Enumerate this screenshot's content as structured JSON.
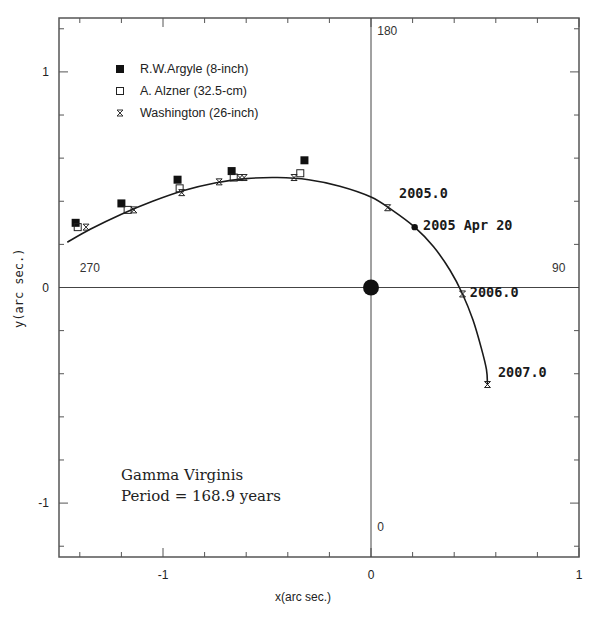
{
  "chart_data": {
    "type": "scatter",
    "title": "Gamma Virginis",
    "subtitle": "Period = 168.9 years",
    "xlabel": "x(arc sec.)",
    "ylabel": "y(arc sec.)",
    "xlim": [
      -1.5,
      1.0
    ],
    "ylim": [
      -1.25,
      1.25
    ],
    "grid": false,
    "x_ticks_major": [
      -1,
      0,
      1
    ],
    "x_tick_labels": [
      "-1",
      "0",
      "1"
    ],
    "y_ticks_major": [
      -1,
      0,
      1
    ],
    "y_tick_labels": [
      "-1",
      "0",
      "1"
    ],
    "minor_tick_step": 0.2,
    "legend_position": "upper-left",
    "compass_labels": [
      {
        "text": "180",
        "x": 0.03,
        "y": 1.17
      },
      {
        "text": "270",
        "x": -1.4,
        "y": 0.07
      },
      {
        "text": "90",
        "x": 0.87,
        "y": 0.07
      },
      {
        "text": "0",
        "x": 0.03,
        "y": -1.13
      }
    ],
    "primary_star": {
      "x": 0,
      "y": 0
    },
    "series": [
      {
        "name": "R.W.Argyle (8-inch)",
        "marker": "filled-square",
        "points": [
          [
            -1.42,
            0.3
          ],
          [
            -1.2,
            0.39
          ],
          [
            -0.93,
            0.5
          ],
          [
            -0.67,
            0.54
          ],
          [
            -0.32,
            0.59
          ]
        ]
      },
      {
        "name": "A. Alzner (32.5-cm)",
        "marker": "open-square",
        "points": [
          [
            -1.41,
            0.28
          ],
          [
            -1.17,
            0.36
          ],
          [
            -0.92,
            0.46
          ],
          [
            -0.66,
            0.51
          ],
          [
            -0.34,
            0.53
          ]
        ]
      },
      {
        "name": "Washington (26-inch)",
        "marker": "cross-box",
        "points": [
          [
            -1.37,
            0.28
          ],
          [
            -1.14,
            0.36
          ],
          [
            -0.91,
            0.44
          ],
          [
            -0.73,
            0.49
          ],
          [
            -0.63,
            0.51
          ],
          [
            -0.61,
            0.51
          ],
          [
            -0.37,
            0.51
          ],
          [
            0.08,
            0.37
          ],
          [
            0.44,
            -0.03
          ],
          [
            0.56,
            -0.45
          ]
        ]
      }
    ],
    "orbit_curve": [
      [
        -1.46,
        0.21
      ],
      [
        -1.35,
        0.27
      ],
      [
        -1.2,
        0.34
      ],
      [
        -1.05,
        0.4
      ],
      [
        -0.9,
        0.45
      ],
      [
        -0.75,
        0.485
      ],
      [
        -0.6,
        0.505
      ],
      [
        -0.45,
        0.51
      ],
      [
        -0.3,
        0.5
      ],
      [
        -0.15,
        0.47
      ],
      [
        0.0,
        0.42
      ],
      [
        0.1,
        0.36
      ],
      [
        0.21,
        0.28
      ],
      [
        0.3,
        0.19
      ],
      [
        0.38,
        0.08
      ],
      [
        0.44,
        -0.03
      ],
      [
        0.49,
        -0.15
      ],
      [
        0.53,
        -0.28
      ],
      [
        0.555,
        -0.38
      ],
      [
        0.56,
        -0.45
      ]
    ],
    "annotations": [
      {
        "text": "2005.0",
        "x": 0.08,
        "y": 0.37,
        "label_x": 0.135,
        "label_y": 0.44
      },
      {
        "text": "2005 Apr 20",
        "x": 0.21,
        "y": 0.28,
        "label_x": 0.25,
        "label_y": 0.29,
        "marker": "filled-dot"
      },
      {
        "text": "2006.0",
        "x": 0.44,
        "y": -0.03,
        "label_x": 0.475,
        "label_y": -0.02
      },
      {
        "text": "2007.0",
        "x": 0.56,
        "y": -0.45,
        "label_x": 0.61,
        "label_y": -0.39
      }
    ]
  },
  "legend": {
    "items": [
      {
        "label": "R.W.Argyle (8-inch)",
        "marker": "filled-square"
      },
      {
        "label": "A. Alzner (32.5-cm)",
        "marker": "open-square"
      },
      {
        "label": "Washington (26-inch)",
        "marker": "cross-box"
      }
    ]
  },
  "info_box": {
    "line1": "Gamma Virginis",
    "line2": "Period = 168.9 years"
  },
  "axes": {
    "xlabel": "x(arc sec.)",
    "ylabel": "y(arc sec.)"
  },
  "colors": {
    "ink": "#1a1a1a",
    "axis": "#555555",
    "background": "#ffffff"
  }
}
